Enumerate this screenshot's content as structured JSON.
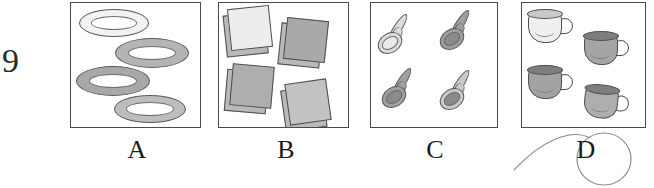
{
  "question": {
    "number": "9",
    "type": "multiple-choice-picture-grid"
  },
  "options": [
    {
      "letter": "A",
      "item_name": "plate",
      "count": 4,
      "items": [
        {
          "id": "plate-1",
          "shade": "#f2f2f2",
          "x": 8,
          "y": 6,
          "w": 70,
          "h": 28
        },
        {
          "id": "plate-2",
          "shade": "#b4b4b4",
          "x": 44,
          "y": 35,
          "w": 74,
          "h": 30
        },
        {
          "id": "plate-3",
          "shade": "#a8a8a8",
          "x": 5,
          "y": 63,
          "w": 74,
          "h": 30
        },
        {
          "id": "plate-4",
          "shade": "#bdbdbd",
          "x": 43,
          "y": 92,
          "w": 72,
          "h": 28
        }
      ]
    },
    {
      "letter": "B",
      "item_name": "napkin",
      "count": 4,
      "items": [
        {
          "id": "napkin-1",
          "shade": "#ededed",
          "x": 10,
          "y": 4,
          "w": 42,
          "h": 42,
          "rot": -6
        },
        {
          "id": "napkin-2",
          "shade": "#a9a9a9",
          "x": 66,
          "y": 16,
          "w": 42,
          "h": 42,
          "rot": 6
        },
        {
          "id": "napkin-3",
          "shade": "#aeaeae",
          "x": 12,
          "y": 62,
          "w": 42,
          "h": 42,
          "rot": 5
        },
        {
          "id": "napkin-4",
          "shade": "#c2c2c2",
          "x": 68,
          "y": 78,
          "w": 42,
          "h": 42,
          "rot": -8
        }
      ]
    },
    {
      "letter": "C",
      "item_name": "spoon",
      "count": 4,
      "items": [
        {
          "id": "spoon-1",
          "shade": "#dcdcdc",
          "x": 6,
          "y": 8,
          "rot": 0
        },
        {
          "id": "spoon-2",
          "shade": "#9d9d9d",
          "x": 68,
          "y": 4,
          "rot": 0
        },
        {
          "id": "spoon-3",
          "shade": "#a0a0a0",
          "x": 10,
          "y": 62,
          "rot": 0
        },
        {
          "id": "spoon-4",
          "shade": "#c9c9c9",
          "x": 68,
          "y": 64,
          "rot": 0
        }
      ]
    },
    {
      "letter": "D",
      "item_name": "cup",
      "count": 4,
      "items": [
        {
          "id": "cup-1",
          "shade": "#efefef",
          "x": 6,
          "y": 6,
          "rot": 0
        },
        {
          "id": "cup-2",
          "shade": "#a5a5a5",
          "x": 62,
          "y": 28,
          "rot": 0
        },
        {
          "id": "cup-3",
          "shade": "#a3a3a3",
          "x": 6,
          "y": 62,
          "rot": 0
        },
        {
          "id": "cup-4",
          "shade": "#aeaeae",
          "x": 62,
          "y": 82,
          "rot": 6
        }
      ]
    }
  ],
  "annotation": {
    "selected_letter": "D",
    "mark_type": "hand-drawn-circle-with-tail",
    "ink_color": "#8c8c94"
  }
}
